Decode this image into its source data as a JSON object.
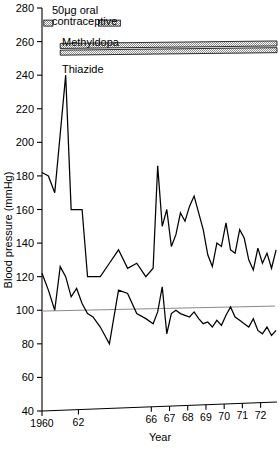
{
  "chart_data": {
    "type": "line",
    "title": "",
    "xlabel": "Year",
    "ylabel": "Blood pressure (mmHg)",
    "xlim": [
      1960,
      1972.9
    ],
    "ylim": [
      40,
      280
    ],
    "grid": false,
    "legend_position": "top-left",
    "y_ticks": [
      40,
      60,
      80,
      100,
      120,
      140,
      160,
      180,
      200,
      220,
      240,
      260,
      280
    ],
    "y_tick_labels": [
      "40",
      "60",
      "80",
      "100",
      "120",
      "140",
      "160",
      "180",
      "200",
      "220",
      "240",
      "260",
      "280"
    ],
    "x_ticks": [
      1960,
      1962,
      1966,
      1967,
      1968,
      1969,
      1970,
      1971,
      1972
    ],
    "x_tick_labels": [
      "1960",
      "62",
      "66",
      "67",
      "68",
      "69",
      "70",
      "71",
      "72"
    ],
    "reference_lines": [
      {
        "name": "diastolic-reference",
        "y": 101,
        "color": "#8a8a8a"
      }
    ],
    "series": [
      {
        "name": "Systolic blood pressure",
        "color": "#000000",
        "x": [
          1960.0,
          1960.35,
          1960.7,
          1961.0,
          1961.3,
          1961.6,
          1961.9,
          1962.2,
          1962.5,
          1962.8,
          1963.2,
          1963.7,
          1964.2,
          1964.7,
          1965.2,
          1965.7,
          1966.1,
          1966.35,
          1966.6,
          1966.85,
          1967.1,
          1967.35,
          1967.6,
          1967.85,
          1968.1,
          1968.35,
          1968.6,
          1968.85,
          1969.1,
          1969.35,
          1969.6,
          1969.85,
          1970.1,
          1970.35,
          1970.6,
          1970.85,
          1971.1,
          1971.35,
          1971.6,
          1971.85,
          1972.1,
          1972.35,
          1972.6,
          1972.85
        ],
        "y": [
          182,
          180,
          170,
          205,
          240,
          160,
          160,
          160,
          120,
          120,
          120,
          128,
          136,
          125,
          128,
          120,
          125,
          186,
          150,
          160,
          138,
          145,
          158,
          153,
          162,
          168,
          158,
          148,
          133,
          126,
          140,
          138,
          152,
          136,
          134,
          148,
          143,
          130,
          124,
          137,
          128,
          134,
          125,
          136
        ]
      },
      {
        "name": "Diastolic blood pressure",
        "color": "#000000",
        "x": [
          1960.0,
          1960.35,
          1960.7,
          1961.0,
          1961.3,
          1961.6,
          1961.9,
          1962.2,
          1962.5,
          1962.8,
          1963.2,
          1963.7,
          1964.2,
          1964.7,
          1965.2,
          1965.7,
          1966.1,
          1966.35,
          1966.6,
          1966.85,
          1967.1,
          1967.35,
          1967.6,
          1967.85,
          1968.1,
          1968.35,
          1968.6,
          1968.85,
          1969.1,
          1969.35,
          1969.6,
          1969.85,
          1970.1,
          1970.35,
          1970.6,
          1970.85,
          1971.1,
          1971.35,
          1971.6,
          1971.85,
          1972.1,
          1972.35,
          1972.6,
          1972.85
        ],
        "y": [
          122,
          112,
          100,
          126,
          120,
          108,
          113,
          104,
          98,
          96,
          90,
          80,
          112,
          110,
          98,
          95,
          92,
          99,
          114,
          86,
          98,
          100,
          98,
          97,
          96,
          99,
          95,
          92,
          93,
          90,
          94,
          91,
          97,
          102,
          96,
          94,
          92,
          90,
          95,
          88,
          86,
          90,
          85,
          88
        ]
      }
    ],
    "treatment_bars": [
      {
        "name": "contraceptive-marker-1",
        "label": "",
        "x_start": 1960.1,
        "x_end": 1960.6,
        "y_value": 271,
        "fill": "#b4b4b4"
      },
      {
        "name": "contraceptive-marker-2",
        "label": "",
        "x_start": 1963.1,
        "x_end": 1964.3,
        "y_value": 271,
        "fill": "#b4b4b4"
      },
      {
        "name": "methyldopa-bar",
        "label": "Methyldopa",
        "x_start": 1961.0,
        "x_end": 1972.9,
        "y_value": 258,
        "fill": "#b4b4b4"
      },
      {
        "name": "thiazide-bar",
        "label": "Thiazide",
        "x_start": 1961.0,
        "x_end": 1972.9,
        "y_value": 254,
        "fill": "#b4b4b4"
      }
    ],
    "annotations": [
      {
        "name": "contraceptive-label-line1",
        "text": "50μg oral"
      },
      {
        "name": "contraceptive-label-line2",
        "text": "contraceptive"
      },
      {
        "name": "methyldopa-label",
        "text": "Methyldopa"
      },
      {
        "name": "thiazide-label",
        "text": "Thiazide"
      }
    ]
  },
  "colors": {
    "line": "#000000",
    "reference": "#8a8a8a",
    "bar_fill": "#b4b4b4",
    "background": "#ffffff"
  }
}
